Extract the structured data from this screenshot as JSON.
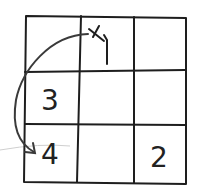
{
  "diagram": {
    "type": "grid",
    "rows": 3,
    "cols": 3,
    "cells": [
      [
        "",
        "x-mark",
        ""
      ],
      [
        "3",
        "",
        ""
      ],
      [
        "4",
        "",
        "2"
      ]
    ],
    "labels": {
      "r2c1": "3",
      "r3c1": "4",
      "r3c3": "2"
    },
    "marks": {
      "start": "x-mark in top-center cell with corner stroke",
      "arrow": "curved arrow from top-center X to bottom-left cell"
    },
    "colors": {
      "ink": "#1e1e1e",
      "background": "#ffffff"
    }
  }
}
